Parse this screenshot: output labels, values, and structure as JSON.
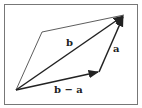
{
  "diagram": {
    "type": "vector-parallelogram",
    "labels": {
      "diagonal": "b",
      "side_right": "a",
      "side_bottom": "b − a"
    },
    "colors": {
      "border": "#777777",
      "line": "#222222",
      "background": "#ffffff"
    }
  }
}
